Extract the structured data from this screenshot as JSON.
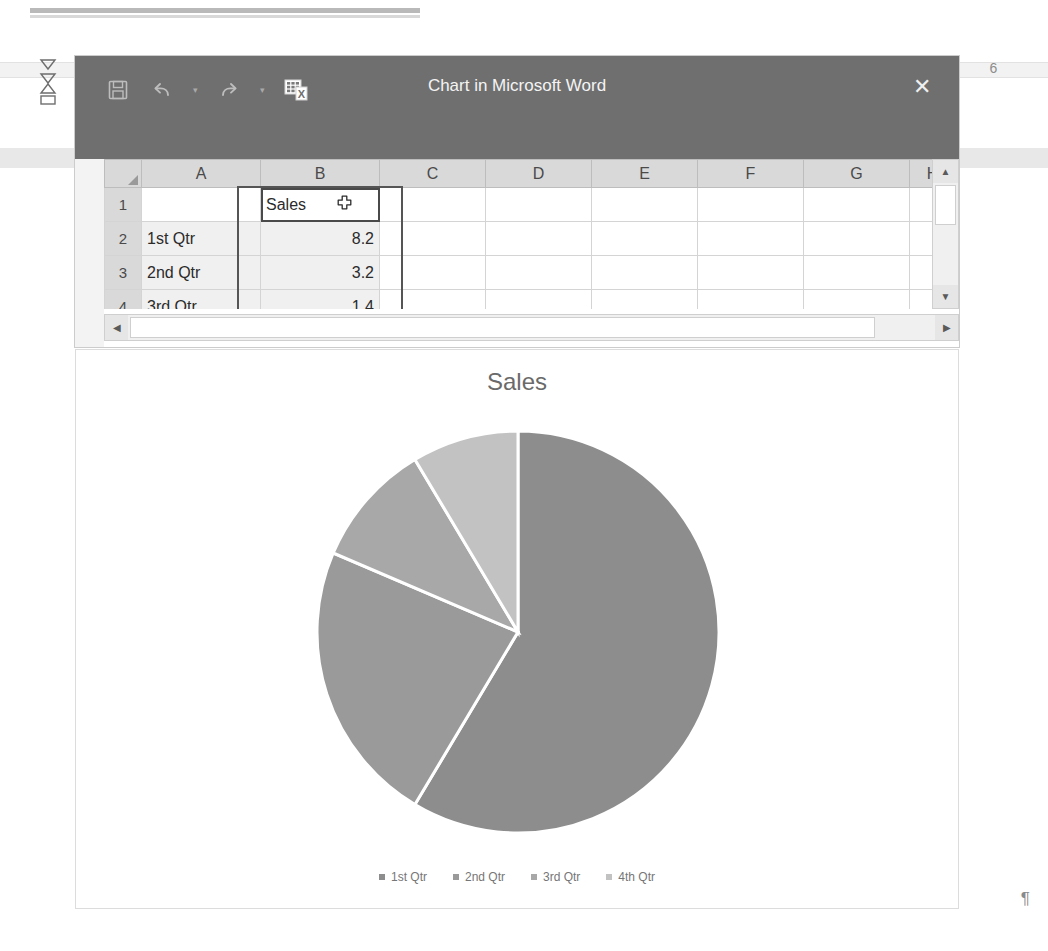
{
  "document": {
    "page_number_marker": "6",
    "paragraph_mark": "¶"
  },
  "dialog": {
    "title": "Chart in Microsoft Word",
    "close_label": "✕",
    "quick_access": [
      {
        "name": "save-icon",
        "tooltip": "Save"
      },
      {
        "name": "undo-icon",
        "tooltip": "Undo"
      },
      {
        "name": "redo-icon",
        "tooltip": "Redo"
      },
      {
        "name": "edit-data-in-excel-icon",
        "tooltip": "Edit Data in Microsoft Excel"
      }
    ]
  },
  "sheet": {
    "column_headers": [
      "A",
      "B",
      "C",
      "D",
      "E",
      "F",
      "G",
      "H"
    ],
    "row_headers": [
      "1",
      "2",
      "3",
      "4"
    ],
    "rows": [
      {
        "row": "1",
        "a": "",
        "b": "Sales",
        "c": "",
        "d": "",
        "e": "",
        "f": "",
        "g": "",
        "h": ""
      },
      {
        "row": "2",
        "a": "1st Qtr",
        "b": "8.2",
        "c": "",
        "d": "",
        "e": "",
        "f": "",
        "g": "",
        "h": ""
      },
      {
        "row": "3",
        "a": "2nd Qtr",
        "b": "3.2",
        "c": "",
        "d": "",
        "e": "",
        "f": "",
        "g": "",
        "h": ""
      },
      {
        "row": "4",
        "a": "3rd Qtr",
        "b": "1.4",
        "c": "",
        "d": "",
        "e": "",
        "f": "",
        "g": "",
        "h": ""
      }
    ],
    "selected_cell": "B1",
    "selected_cell_value": "Sales",
    "scroll": {
      "vertical_up": "▲",
      "vertical_down": "▼",
      "horizontal_left": "◀",
      "horizontal_right": "▶"
    }
  },
  "chart_data": {
    "type": "pie",
    "title": "Sales",
    "categories": [
      "1st Qtr",
      "2nd Qtr",
      "3rd Qtr",
      "4th Qtr"
    ],
    "values": [
      8.2,
      3.2,
      1.4,
      1.2
    ],
    "total": 14.0,
    "percentages": [
      58.6,
      22.9,
      10.0,
      8.6
    ],
    "start_angle_deg": 0,
    "direction": "clockwise",
    "slice_colors": [
      "#8d8d8d",
      "#9a9a9a",
      "#a8a8a8",
      "#c2c2c2"
    ],
    "slice_border_color": "#ffffff",
    "legend": {
      "position": "bottom",
      "entries": [
        "1st Qtr",
        "2nd Qtr",
        "3rd Qtr",
        "4th Qtr"
      ]
    },
    "title_color": "#6a6a6a",
    "legend_text_color": "#767676",
    "grid": false,
    "xlabel": "",
    "ylabel": ""
  }
}
